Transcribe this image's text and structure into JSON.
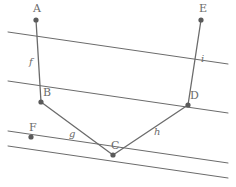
{
  "figure": {
    "width": 236,
    "height": 187,
    "background_color": "#ffffff",
    "stroke_color": "#6b6b6b",
    "point_fill_color": "#5a5a5a",
    "label_color": "#6b6b6b"
  },
  "points": [
    {
      "id": "A",
      "label": "A",
      "x": 36,
      "y": 20,
      "label_x": 33,
      "label_y": 3,
      "r": 2.6
    },
    {
      "id": "B",
      "label": "B",
      "x": 41,
      "y": 102,
      "label_x": 43,
      "label_y": 87,
      "r": 2.6
    },
    {
      "id": "C",
      "label": "C",
      "x": 113,
      "y": 155,
      "label_x": 111,
      "label_y": 140,
      "r": 2.6
    },
    {
      "id": "D",
      "label": "D",
      "x": 188,
      "y": 105,
      "label_x": 190,
      "label_y": 90,
      "r": 2.6
    },
    {
      "id": "E",
      "label": "E",
      "x": 201,
      "y": 20,
      "label_x": 199,
      "label_y": 3,
      "r": 2.6
    },
    {
      "id": "F",
      "label": "F",
      "x": 31,
      "y": 137,
      "label_x": 29,
      "label_y": 122,
      "r": 2.6
    }
  ],
  "segments": [
    {
      "id": "f",
      "label": "f",
      "from": "A",
      "to": "B",
      "x1": 36,
      "y1": 20,
      "x2": 41,
      "y2": 102,
      "label_x": 29,
      "label_y": 57
    },
    {
      "id": "g",
      "label": "g",
      "from": "B",
      "to": "C",
      "x1": 41,
      "y1": 102,
      "x2": 113,
      "y2": 155,
      "label_x": 69,
      "label_y": 129
    },
    {
      "id": "h",
      "label": "h",
      "from": "C",
      "to": "D",
      "x1": 113,
      "y1": 155,
      "x2": 188,
      "y2": 105,
      "label_x": 154,
      "label_y": 127
    },
    {
      "id": "i",
      "label": "i",
      "from": "D",
      "to": "E",
      "x1": 188,
      "y1": 105,
      "x2": 201,
      "y2": 20,
      "label_x": 201,
      "label_y": 54
    }
  ],
  "parallel_lines": [
    {
      "id": "line-1",
      "x1": 8,
      "y1": 32,
      "x2": 228,
      "y2": 64
    },
    {
      "id": "line-2",
      "x1": 8,
      "y1": 81,
      "x2": 228,
      "y2": 113
    },
    {
      "id": "line-3",
      "x1": 8,
      "y1": 131,
      "x2": 228,
      "y2": 163
    },
    {
      "id": "line-4",
      "x1": 8,
      "y1": 146,
      "x2": 228,
      "y2": 178
    }
  ]
}
